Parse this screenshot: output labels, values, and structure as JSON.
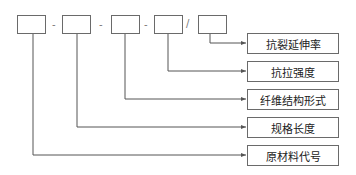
{
  "diagram": {
    "type": "code-structure",
    "code_fields": [
      {
        "id": "field-1",
        "label": ""
      },
      {
        "id": "field-2",
        "label": ""
      },
      {
        "id": "field-3",
        "label": ""
      },
      {
        "id": "field-4",
        "label": ""
      },
      {
        "id": "field-5",
        "label": ""
      }
    ],
    "separators": [
      "-",
      "-",
      "-",
      "/"
    ],
    "labels": [
      "抗裂延伸率",
      "抗拉强度",
      "纤维结构形式",
      "规格长度",
      "原材料代号"
    ],
    "connections": [
      {
        "from": "field-5",
        "to": "抗裂延伸率"
      },
      {
        "from": "field-4",
        "to": "抗拉强度"
      },
      {
        "from": "field-3",
        "to": "纤维结构形式"
      },
      {
        "from": "field-2",
        "to": "规格长度"
      },
      {
        "from": "field-1",
        "to": "原材料代号"
      }
    ],
    "line_color": "#555555"
  }
}
